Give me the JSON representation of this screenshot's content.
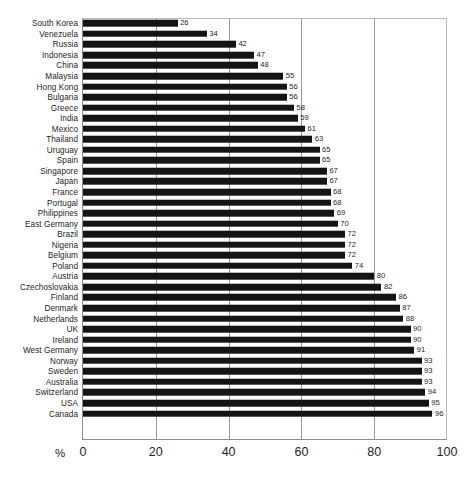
{
  "chart_data": {
    "type": "bar",
    "orientation": "horizontal",
    "title": "",
    "subtitle": "",
    "xlabel": "%",
    "ylabel": "",
    "xlim": [
      0,
      100
    ],
    "xticks": [
      0,
      20,
      40,
      60,
      80,
      100
    ],
    "grid": true,
    "legend": null,
    "bar_color": "#141414",
    "categories": [
      "South Korea",
      "Venezuela",
      "Russia",
      "Indonesia",
      "China",
      "Malaysia",
      "Hong Kong",
      "Bulgaria",
      "Greece",
      "India",
      "Mexico",
      "Thailand",
      "Uruguay",
      "Spain",
      "Singapore",
      "Japan",
      "France",
      "Portugal",
      "Philippines",
      "East Germany",
      "Brazil",
      "Nigeria",
      "Belgium",
      "Poland",
      "Austria",
      "Czechoslovakia",
      "Finland",
      "Denmark",
      "Netherlands",
      "UK",
      "Ireland",
      "West Germany",
      "Norway",
      "Sweden",
      "Australia",
      "Switzerland",
      "USA",
      "Canada"
    ],
    "values": [
      26,
      34,
      42,
      47,
      48,
      55,
      56,
      56,
      58,
      59,
      61,
      63,
      65,
      65,
      67,
      67,
      68,
      68,
      69,
      70,
      72,
      72,
      72,
      74,
      80,
      82,
      86,
      87,
      88,
      90,
      90,
      91,
      93,
      93,
      93,
      94,
      95,
      96
    ]
  }
}
